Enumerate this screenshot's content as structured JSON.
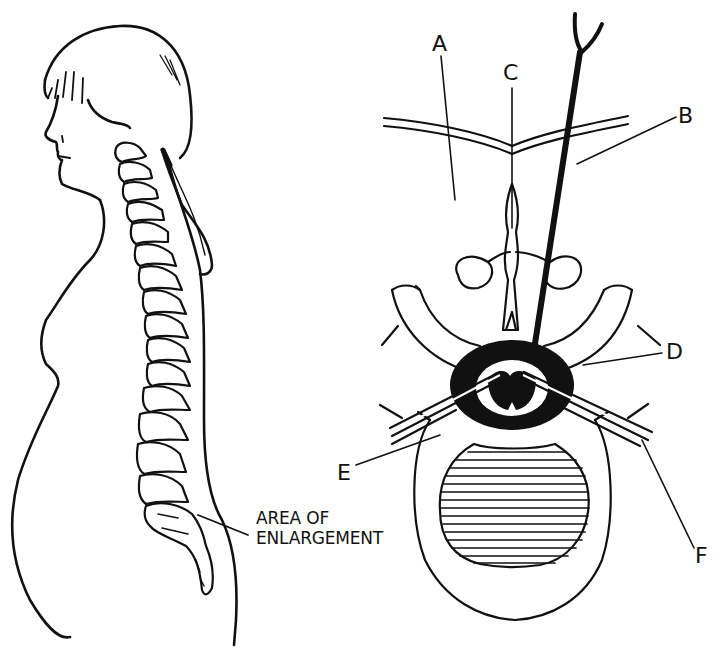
{
  "figure": {
    "left_panel": {
      "description": "side-profile-figure-with-spine",
      "caption_lines": [
        "AREA OF",
        "ENLARGEMENT"
      ]
    },
    "right_panel": {
      "description": "cross-section-of-vertebra-with-needle",
      "labels": {
        "A": "A",
        "B": "B",
        "C": "C",
        "D": "D",
        "E": "E",
        "F": "F"
      }
    },
    "colors": {
      "ink": "#111111",
      "background": "#ffffff"
    }
  }
}
